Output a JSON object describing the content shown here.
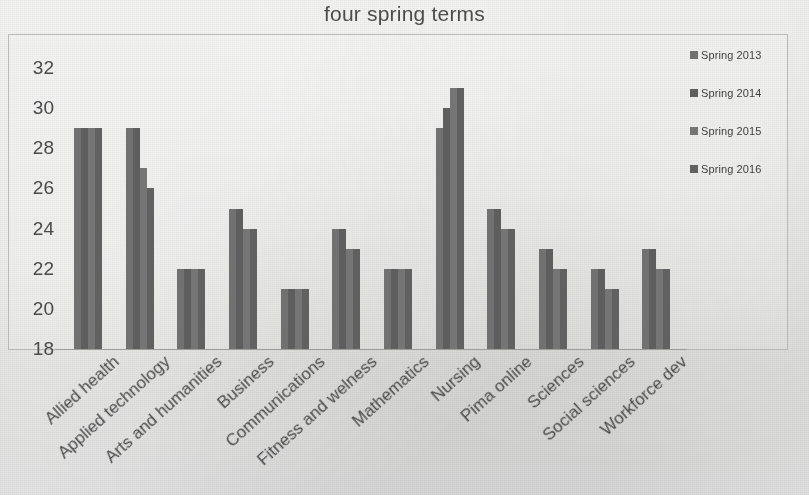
{
  "chart_data": {
    "type": "bar",
    "title": "four spring terms",
    "xlabel": "",
    "ylabel": "",
    "ylim": [
      18,
      32
    ],
    "yticks": [
      18,
      20,
      22,
      24,
      26,
      28,
      30,
      32
    ],
    "grid": false,
    "legend_position": "right",
    "categories": [
      "Allied health",
      "Applied technology",
      "Arts and humanities",
      "Business",
      "Communications",
      "Fitness and welness",
      "Mathematics",
      "Nursing",
      "Pima online",
      "Sciences",
      "Social sciences",
      "Workforce dev"
    ],
    "series": [
      {
        "name": "Spring 2013",
        "color": "#717171",
        "values": [
          29,
          29,
          22,
          25,
          21,
          24,
          22,
          29,
          25,
          23,
          22,
          23
        ]
      },
      {
        "name": "Spring 2014",
        "color": "#5e5e5e",
        "values": [
          29,
          29,
          22,
          25,
          21,
          24,
          22,
          30,
          25,
          23,
          22,
          23
        ]
      },
      {
        "name": "Spring 2015",
        "color": "#757575",
        "values": [
          29,
          27,
          22,
          24,
          21,
          23,
          22,
          31,
          24,
          22,
          21,
          22
        ]
      },
      {
        "name": "Spring 2016",
        "color": "#616161",
        "values": [
          29,
          26,
          22,
          24,
          21,
          23,
          22,
          31,
          24,
          22,
          21,
          22
        ]
      }
    ]
  }
}
